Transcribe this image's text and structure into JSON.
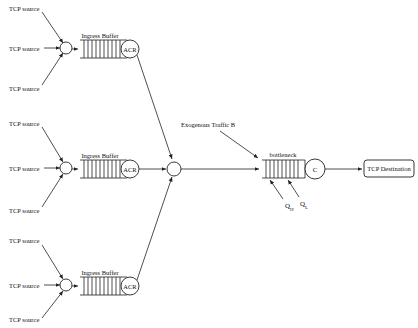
{
  "diagram": {
    "type": "network-queue-diagram",
    "groups": [
      {
        "sources": [
          "TCP source",
          "TCP source",
          "TCP source"
        ],
        "buffer_label": "Ingress Buffer",
        "rate_controller_label": "ACR"
      },
      {
        "sources": [
          "TCP source",
          "TCP source",
          "TCP source"
        ],
        "buffer_label": "Ingress Buffer",
        "rate_controller_label": "ACR"
      },
      {
        "sources": [
          "TCP source",
          "TCP source",
          "TCP source"
        ],
        "buffer_label": "Ingress Buffer",
        "rate_controller_label": "ACR"
      }
    ],
    "exogenous_label": "Exogenous Traffic B",
    "bottleneck_label": "bottleneck",
    "server_label": "C",
    "destination_label": "TCP Destination",
    "threshold_high": {
      "main": "Q",
      "sub": "H"
    },
    "threshold_low": {
      "main": "Q",
      "sub": "L"
    }
  }
}
